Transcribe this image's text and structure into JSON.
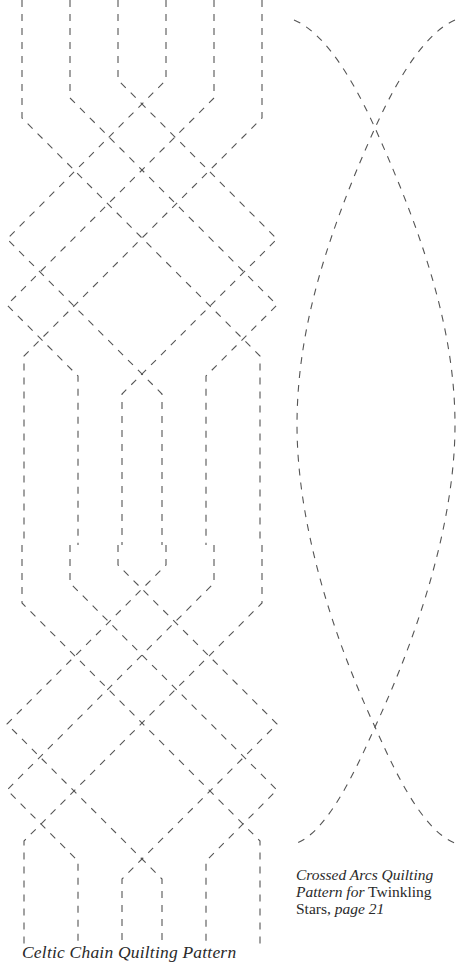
{
  "page": {
    "background": "#ffffff",
    "stroke_color": "#555555"
  },
  "celtic_chain": {
    "caption": "Celtic Chain Quilting Pattern",
    "columns_x": [
      22,
      70,
      118,
      166,
      214,
      262
    ],
    "repeats": [
      {
        "vertical_top_y": 0,
        "offset_y": 0
      },
      {
        "vertical_top_y": 415,
        "offset_y": 485
      }
    ],
    "paths": [
      "M22 0 L22 118 L141 237 L22 356 L22 545",
      "M70 0 L70 98 L7 161 L7 161",
      "M70 0 L70 98 L209 237 L70 376 L70 545",
      "M118 0 L118 80 L275 237 L118 394 L118 545",
      "M166 0 L166 80 L9 237 L166 394 L166 545",
      "M214 0 L214 98 L75 237 L214 376 L214 545",
      "M262 0 L262 118 L143 237 L262 356 L262 545"
    ]
  },
  "crossed_arcs": {
    "caption_parts": [
      {
        "text": "Crossed Arcs Quilting",
        "italic": true
      },
      {
        "text": "Pattern for",
        "italic": true
      },
      {
        "text": " Twinkling",
        "italic": false
      },
      {
        "text": "Stars, ",
        "italic": false
      },
      {
        "text": "page 21",
        "italic": true
      }
    ],
    "caption_lines": [
      "Crossed Arcs Quilting",
      "Pattern for Twinkling",
      "Stars, page 21"
    ],
    "crossings": [
      {
        "x": 375,
        "y": 128
      },
      {
        "x": 375,
        "y": 727
      }
    ],
    "arcs": [
      "M294 20 C330 35 360 95 375 128 C430 250 455 340 455 425 C455 520 420 630 375 727 C360 760 330 830 297 843",
      "M455 20 C420 35 390 95 375 128 C320 250 297 340 297 425 C297 520 330 630 375 727 C390 760 420 830 455 843"
    ]
  }
}
